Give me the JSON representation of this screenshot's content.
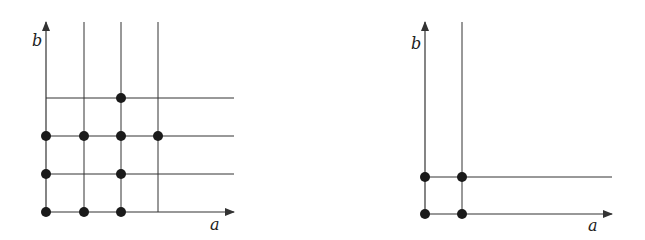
{
  "diagrams": [
    {
      "id": "left",
      "x_axis_label": "a",
      "y_axis_label": "b",
      "origin": [
        46,
        212
      ],
      "axis_end": [
        234,
        22
      ],
      "vertical_lines": [
        84,
        121,
        158
      ],
      "horizontal_lines": [
        98,
        136,
        174
      ],
      "points": [
        [
          46,
          212
        ],
        [
          84,
          212
        ],
        [
          121,
          212
        ],
        [
          46,
          174
        ],
        [
          121,
          174
        ],
        [
          46,
          136
        ],
        [
          84,
          136
        ],
        [
          121,
          136
        ],
        [
          158,
          136
        ],
        [
          121,
          98
        ]
      ]
    },
    {
      "id": "right",
      "x_axis_label": "a",
      "y_axis_label": "b",
      "origin": [
        425,
        214
      ],
      "axis_end": [
        612,
        22
      ],
      "vertical_lines": [
        462
      ],
      "horizontal_lines": [
        177
      ],
      "points": [
        [
          425,
          214
        ],
        [
          462,
          214
        ],
        [
          425,
          177
        ],
        [
          462,
          177
        ]
      ]
    }
  ],
  "line_color": "#333333",
  "point_color": "#1a1a1a"
}
